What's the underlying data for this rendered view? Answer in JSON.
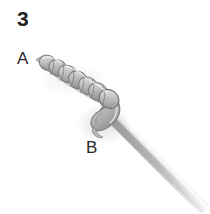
{
  "figure": {
    "type": "instructional-line-drawing",
    "step_number": "3",
    "background_color": "#ffffff",
    "width": 210,
    "height": 214,
    "labels": {
      "step": "3",
      "point_a": "A",
      "point_b": "B"
    },
    "label_color": "#2b2b2b",
    "illustration": {
      "description": "grayscale pencil-shaded drawing of a monofilament line wrapped in a coil of barrel wraps running from upper-left down to a knot, with the tag end tucked through a bight that loops under the standing line, the standing line continuing to the lower-right and fading out",
      "coil": {
        "wrap_count": 7,
        "start_point": [
          40,
          60
        ],
        "end_point": [
          112,
          104
        ],
        "fill_light": "#e2e2e2",
        "fill_mid": "#b4b4b4",
        "fill_dark": "#8a8a8a",
        "outline_color": "#6e6e6e"
      },
      "bight": {
        "description": "tag end loop passing down and around the standing line near label B",
        "center": [
          106,
          118
        ],
        "fill_light": "#dcdcdc",
        "fill_dark": "#909090"
      },
      "standing_line": {
        "from": [
          112,
          112
        ],
        "to": [
          206,
          208
        ],
        "fill_near": "#9e9e9e",
        "fill_far": "#f0f0f0",
        "thickness_near": 9,
        "thickness_far": 3
      }
    }
  }
}
